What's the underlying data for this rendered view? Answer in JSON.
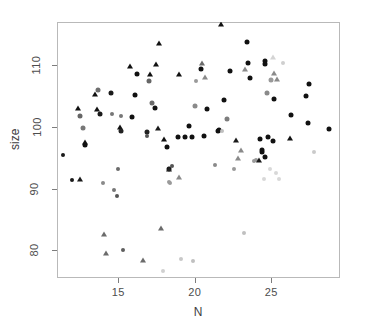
{
  "chart_data": {
    "type": "scatter",
    "title": "",
    "xlabel": "N",
    "ylabel": "size",
    "xlim": [
      11.0,
      29.5
    ],
    "ylim": [
      75.5,
      117.0
    ],
    "xticks": [
      15,
      20,
      25
    ],
    "xticklabels": [
      "15",
      "20",
      "25"
    ],
    "yticks": [
      80,
      90,
      100,
      110
    ],
    "yticklabels": [
      "80",
      "90",
      "100",
      "110"
    ],
    "grid": false,
    "legend": null,
    "marker_shapes": [
      "circle",
      "triangle"
    ],
    "marker_colors_note": "points are shaded from black through mid-grey to very light grey",
    "points": [
      {
        "x": 11.4,
        "y": 95.5,
        "shape": "circle",
        "color": "#1a1a1a",
        "size": 4
      },
      {
        "x": 12.0,
        "y": 91.4,
        "shape": "circle",
        "color": "#1a1a1a",
        "size": 4
      },
      {
        "x": 12.4,
        "y": 103.0,
        "shape": "triangle",
        "color": "#111111",
        "size": 6
      },
      {
        "x": 12.5,
        "y": 101.8,
        "shape": "circle",
        "color": "#666666",
        "size": 5
      },
      {
        "x": 12.5,
        "y": 91.5,
        "shape": "triangle",
        "color": "#1a1a1a",
        "size": 6
      },
      {
        "x": 12.7,
        "y": 99.8,
        "shape": "circle",
        "color": "#777777",
        "size": 5
      },
      {
        "x": 12.8,
        "y": 97.5,
        "shape": "triangle",
        "color": "#111111",
        "size": 6
      },
      {
        "x": 12.8,
        "y": 97.1,
        "shape": "circle",
        "color": "#111111",
        "size": 5
      },
      {
        "x": 13.5,
        "y": 105.3,
        "shape": "triangle",
        "color": "#111111",
        "size": 6
      },
      {
        "x": 13.6,
        "y": 102.9,
        "shape": "triangle",
        "color": "#111111",
        "size": 6
      },
      {
        "x": 13.7,
        "y": 106.0,
        "shape": "circle",
        "color": "#6e6e6e",
        "size": 5
      },
      {
        "x": 13.8,
        "y": 102.1,
        "shape": "circle",
        "color": "#1a1a1a",
        "size": 5
      },
      {
        "x": 14.0,
        "y": 90.9,
        "shape": "circle",
        "color": "#8a8a8a",
        "size": 4
      },
      {
        "x": 14.1,
        "y": 82.7,
        "shape": "triangle",
        "color": "#6b6b6b",
        "size": 6
      },
      {
        "x": 14.2,
        "y": 79.5,
        "shape": "triangle",
        "color": "#6b6b6b",
        "size": 6
      },
      {
        "x": 14.5,
        "y": 105.5,
        "shape": "circle",
        "color": "#1a1a1a",
        "size": 5
      },
      {
        "x": 14.6,
        "y": 102.1,
        "shape": "circle",
        "color": "#777777",
        "size": 4
      },
      {
        "x": 14.7,
        "y": 89.7,
        "shape": "circle",
        "color": "#777777",
        "size": 4
      },
      {
        "x": 14.9,
        "y": 88.8,
        "shape": "circle",
        "color": "#555555",
        "size": 4
      },
      {
        "x": 15.0,
        "y": 93.1,
        "shape": "circle",
        "color": "#6b6b6b",
        "size": 4
      },
      {
        "x": 15.1,
        "y": 99.9,
        "shape": "triangle",
        "color": "#111111",
        "size": 6
      },
      {
        "x": 15.2,
        "y": 99.4,
        "shape": "circle",
        "color": "#222222",
        "size": 5
      },
      {
        "x": 15.2,
        "y": 101.8,
        "shape": "circle",
        "color": "#777777",
        "size": 4
      },
      {
        "x": 15.3,
        "y": 80.0,
        "shape": "circle",
        "color": "#5e5e5e",
        "size": 4
      },
      {
        "x": 15.8,
        "y": 109.9,
        "shape": "triangle",
        "color": "#111111",
        "size": 6
      },
      {
        "x": 15.9,
        "y": 101.6,
        "shape": "circle",
        "color": "#111111",
        "size": 5
      },
      {
        "x": 16.1,
        "y": 105.2,
        "shape": "circle",
        "color": "#111111",
        "size": 5
      },
      {
        "x": 16.2,
        "y": 108.6,
        "shape": "circle",
        "color": "#111111",
        "size": 5
      },
      {
        "x": 16.6,
        "y": 78.4,
        "shape": "triangle",
        "color": "#6b6b6b",
        "size": 6
      },
      {
        "x": 16.9,
        "y": 99.1,
        "shape": "circle",
        "color": "#222222",
        "size": 5
      },
      {
        "x": 16.9,
        "y": 98.5,
        "shape": "circle",
        "color": "#555555",
        "size": 4
      },
      {
        "x": 17.0,
        "y": 107.4,
        "shape": "circle",
        "color": "#666666",
        "size": 5
      },
      {
        "x": 17.1,
        "y": 108.6,
        "shape": "triangle",
        "color": "#111111",
        "size": 6
      },
      {
        "x": 17.2,
        "y": 103.8,
        "shape": "circle",
        "color": "#6b6b6b",
        "size": 5
      },
      {
        "x": 17.4,
        "y": 103.0,
        "shape": "circle",
        "color": "#111111",
        "size": 5
      },
      {
        "x": 17.5,
        "y": 110.2,
        "shape": "triangle",
        "color": "#111111",
        "size": 6
      },
      {
        "x": 17.6,
        "y": 99.8,
        "shape": "triangle",
        "color": "#1a1a1a",
        "size": 6
      },
      {
        "x": 17.7,
        "y": 113.6,
        "shape": "triangle",
        "color": "#111111",
        "size": 6
      },
      {
        "x": 17.8,
        "y": 83.6,
        "shape": "triangle",
        "color": "#6b6b6b",
        "size": 6
      },
      {
        "x": 17.9,
        "y": 76.6,
        "shape": "circle",
        "color": "#d0d0d0",
        "size": 4
      },
      {
        "x": 18.0,
        "y": 98.0,
        "shape": "triangle",
        "color": "#111111",
        "size": 6
      },
      {
        "x": 18.2,
        "y": 96.7,
        "shape": "circle",
        "color": "#111111",
        "size": 5
      },
      {
        "x": 18.3,
        "y": 93.1,
        "shape": "circle",
        "color": "#111111",
        "size": 5
      },
      {
        "x": 18.3,
        "y": 93.2,
        "shape": "triangle",
        "color": "#222222",
        "size": 6
      },
      {
        "x": 18.3,
        "y": 91.1,
        "shape": "circle",
        "color": "#9a9a9a",
        "size": 4
      },
      {
        "x": 18.4,
        "y": 90.9,
        "shape": "circle",
        "color": "#9a9a9a",
        "size": 4
      },
      {
        "x": 18.5,
        "y": 93.6,
        "shape": "circle",
        "color": "#555555",
        "size": 4
      },
      {
        "x": 18.9,
        "y": 98.3,
        "shape": "circle",
        "color": "#111111",
        "size": 5
      },
      {
        "x": 19.0,
        "y": 108.5,
        "shape": "triangle",
        "color": "#111111",
        "size": 6
      },
      {
        "x": 19.0,
        "y": 91.9,
        "shape": "triangle",
        "color": "#8a8a8a",
        "size": 6
      },
      {
        "x": 19.1,
        "y": 78.5,
        "shape": "circle",
        "color": "#c8c8c8",
        "size": 4
      },
      {
        "x": 19.4,
        "y": 98.4,
        "shape": "circle",
        "color": "#111111",
        "size": 5
      },
      {
        "x": 19.6,
        "y": 100.2,
        "shape": "circle",
        "color": "#111111",
        "size": 5
      },
      {
        "x": 19.8,
        "y": 98.4,
        "shape": "circle",
        "color": "#111111",
        "size": 5
      },
      {
        "x": 19.9,
        "y": 78.3,
        "shape": "circle",
        "color": "#c0c0c0",
        "size": 4
      },
      {
        "x": 20.0,
        "y": 103.4,
        "shape": "circle",
        "color": "#8a8a8a",
        "size": 5
      },
      {
        "x": 20.1,
        "y": 107.4,
        "shape": "circle",
        "color": "#9a9a9a",
        "size": 4
      },
      {
        "x": 20.4,
        "y": 109.3,
        "shape": "circle",
        "color": "#111111",
        "size": 5
      },
      {
        "x": 20.5,
        "y": 110.4,
        "shape": "triangle",
        "color": "#6b6b6b",
        "size": 6
      },
      {
        "x": 20.6,
        "y": 98.5,
        "shape": "circle",
        "color": "#111111",
        "size": 5
      },
      {
        "x": 20.7,
        "y": 108.1,
        "shape": "triangle",
        "color": "#8a8a8a",
        "size": 6
      },
      {
        "x": 20.8,
        "y": 102.9,
        "shape": "circle",
        "color": "#111111",
        "size": 5
      },
      {
        "x": 21.3,
        "y": 93.8,
        "shape": "circle",
        "color": "#8a8a8a",
        "size": 4
      },
      {
        "x": 21.5,
        "y": 99.4,
        "shape": "circle",
        "color": "#111111",
        "size": 5
      },
      {
        "x": 21.6,
        "y": 99.5,
        "shape": "circle",
        "color": "#111111",
        "size": 5
      },
      {
        "x": 21.7,
        "y": 116.7,
        "shape": "triangle",
        "color": "#111111",
        "size": 6
      },
      {
        "x": 21.8,
        "y": 99.3,
        "shape": "circle",
        "color": "#bfbfbf",
        "size": 4
      },
      {
        "x": 21.9,
        "y": 104.4,
        "shape": "circle",
        "color": "#111111",
        "size": 5
      },
      {
        "x": 22.1,
        "y": 101.2,
        "shape": "circle",
        "color": "#7d7d7d",
        "size": 5
      },
      {
        "x": 22.3,
        "y": 109.0,
        "shape": "circle",
        "color": "#111111",
        "size": 5
      },
      {
        "x": 22.6,
        "y": 93.2,
        "shape": "circle",
        "color": "#9a9a9a",
        "size": 4
      },
      {
        "x": 22.7,
        "y": 97.9,
        "shape": "triangle",
        "color": "#1a1a1a",
        "size": 6
      },
      {
        "x": 22.8,
        "y": 94.9,
        "shape": "triangle",
        "color": "#8a8a8a",
        "size": 6
      },
      {
        "x": 23.0,
        "y": 96.3,
        "shape": "triangle",
        "color": "#8a8a8a",
        "size": 6
      },
      {
        "x": 23.2,
        "y": 82.8,
        "shape": "circle",
        "color": "#c0c0c0",
        "size": 4
      },
      {
        "x": 23.3,
        "y": 109.3,
        "shape": "triangle",
        "color": "#8a8a8a",
        "size": 6
      },
      {
        "x": 23.4,
        "y": 113.8,
        "shape": "circle",
        "color": "#111111",
        "size": 5
      },
      {
        "x": 23.5,
        "y": 110.4,
        "shape": "circle",
        "color": "#111111",
        "size": 5
      },
      {
        "x": 23.6,
        "y": 107.9,
        "shape": "circle",
        "color": "#111111",
        "size": 5
      },
      {
        "x": 23.9,
        "y": 94.5,
        "shape": "circle",
        "color": "#9a9a9a",
        "size": 4
      },
      {
        "x": 24.0,
        "y": 94.7,
        "shape": "circle",
        "color": "#9a9a9a",
        "size": 4
      },
      {
        "x": 24.2,
        "y": 94.6,
        "shape": "triangle",
        "color": "#1a1a1a",
        "size": 6
      },
      {
        "x": 24.3,
        "y": 98.1,
        "shape": "circle",
        "color": "#111111",
        "size": 5
      },
      {
        "x": 24.4,
        "y": 96.3,
        "shape": "circle",
        "color": "#111111",
        "size": 5
      },
      {
        "x": 24.4,
        "y": 95.9,
        "shape": "circle",
        "color": "#111111",
        "size": 5
      },
      {
        "x": 24.5,
        "y": 91.6,
        "shape": "circle",
        "color": "#d8d8d8",
        "size": 4
      },
      {
        "x": 24.6,
        "y": 110.7,
        "shape": "circle",
        "color": "#111111",
        "size": 5
      },
      {
        "x": 24.6,
        "y": 110.2,
        "shape": "circle",
        "color": "#111111",
        "size": 5
      },
      {
        "x": 24.6,
        "y": 95.1,
        "shape": "circle",
        "color": "#111111",
        "size": 5
      },
      {
        "x": 24.7,
        "y": 105.5,
        "shape": "circle",
        "color": "#8a8a8a",
        "size": 5
      },
      {
        "x": 24.8,
        "y": 98.4,
        "shape": "circle",
        "color": "#111111",
        "size": 5
      },
      {
        "x": 24.9,
        "y": 93.1,
        "shape": "circle",
        "color": "#d8d8d8",
        "size": 4
      },
      {
        "x": 25.0,
        "y": 107.6,
        "shape": "circle",
        "color": "#9a9a9a",
        "size": 5
      },
      {
        "x": 25.1,
        "y": 111.4,
        "shape": "triangle",
        "color": "#d4d4d4",
        "size": 6
      },
      {
        "x": 25.1,
        "y": 97.7,
        "shape": "circle",
        "color": "#111111",
        "size": 5
      },
      {
        "x": 25.2,
        "y": 104.5,
        "shape": "circle",
        "color": "#111111",
        "size": 5
      },
      {
        "x": 25.2,
        "y": 108.7,
        "shape": "triangle",
        "color": "#8a8a8a",
        "size": 6
      },
      {
        "x": 25.3,
        "y": 92.6,
        "shape": "circle",
        "color": "#d8d8d8",
        "size": 4
      },
      {
        "x": 25.4,
        "y": 107.8,
        "shape": "triangle",
        "color": "#8a8a8a",
        "size": 6
      },
      {
        "x": 25.5,
        "y": 91.5,
        "shape": "circle",
        "color": "#d8d8d8",
        "size": 4
      },
      {
        "x": 25.8,
        "y": 110.4,
        "shape": "circle",
        "color": "#cfcfcf",
        "size": 4
      },
      {
        "x": 26.2,
        "y": 98.2,
        "shape": "triangle",
        "color": "#111111",
        "size": 6
      },
      {
        "x": 26.3,
        "y": 102.0,
        "shape": "circle",
        "color": "#111111",
        "size": 5
      },
      {
        "x": 27.3,
        "y": 105.0,
        "shape": "circle",
        "color": "#111111",
        "size": 5
      },
      {
        "x": 27.4,
        "y": 100.7,
        "shape": "circle",
        "color": "#111111",
        "size": 5
      },
      {
        "x": 27.5,
        "y": 107.0,
        "shape": "circle",
        "color": "#111111",
        "size": 5
      },
      {
        "x": 27.8,
        "y": 95.9,
        "shape": "circle",
        "color": "#cacaca",
        "size": 4
      },
      {
        "x": 28.8,
        "y": 99.6,
        "shape": "circle",
        "color": "#111111",
        "size": 5
      }
    ]
  },
  "axes": {
    "x_label": "N",
    "y_label": "size",
    "x_tick_labels": [
      "15",
      "20",
      "25"
    ],
    "y_tick_labels": [
      "80",
      "90",
      "100",
      "110"
    ]
  },
  "style": {
    "box_border_color": "#b9b9b9",
    "tick_color": "#7d7d7d",
    "label_color": "#3d3d3d",
    "background": "#ffffff"
  }
}
